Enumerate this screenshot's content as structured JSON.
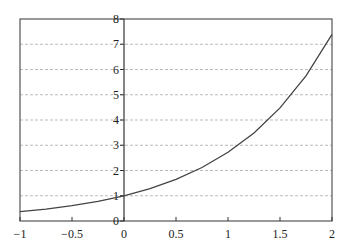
{
  "chart_data": {
    "type": "line",
    "title": "",
    "xlabel": "",
    "ylabel": "",
    "xlim": [
      -1,
      2
    ],
    "ylim": [
      0,
      8
    ],
    "grid": {
      "y": true,
      "x": false,
      "style": "dashed"
    },
    "legend": null,
    "x_ticks": [
      -1,
      -0.5,
      0,
      0.5,
      1,
      1.5,
      2
    ],
    "x_tick_labels": [
      "−1",
      "−0.5",
      "0",
      "0.5",
      "1",
      "1.5",
      "2"
    ],
    "y_ticks": [
      0,
      1,
      2,
      3,
      4,
      5,
      6,
      7,
      8
    ],
    "y_tick_labels": [
      "0",
      "1",
      "2",
      "3",
      "4",
      "5",
      "6",
      "7",
      "8"
    ],
    "series": [
      {
        "name": "exp(x)",
        "x": [
          -1,
          -0.75,
          -0.5,
          -0.25,
          0,
          0.25,
          0.5,
          0.75,
          1,
          1.25,
          1.5,
          1.75,
          2
        ],
        "y": [
          0.37,
          0.47,
          0.61,
          0.78,
          1.0,
          1.28,
          1.65,
          2.12,
          2.72,
          3.49,
          4.48,
          5.75,
          7.39
        ],
        "color": "#444444"
      }
    ]
  }
}
